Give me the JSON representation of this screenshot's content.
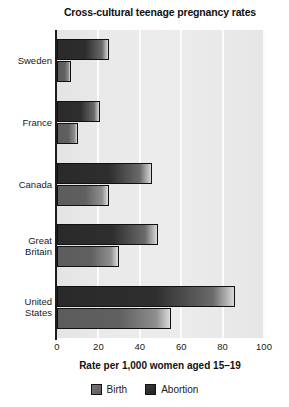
{
  "chart_data": {
    "type": "bar",
    "orientation": "horizontal",
    "title": "Cross-cultural teenage pregnancy rates",
    "xlabel": "Rate per 1,000 women aged 15–19",
    "ylabel": "",
    "xlim": [
      0,
      100
    ],
    "xticks": [
      "0",
      "20",
      "40",
      "60",
      "80",
      "100"
    ],
    "grid": "vertical-white-gridlines",
    "legend_position": "bottom-center",
    "categories": [
      "Sweden",
      "France",
      "Canada",
      "Great\nBritain",
      "United\nStates"
    ],
    "series": [
      {
        "name": "Abortion",
        "color": "#2a2a2a",
        "values": [
          25,
          21,
          46,
          49,
          86
        ]
      },
      {
        "name": "Birth",
        "color": "#5c5c5c",
        "values": [
          7,
          10,
          25,
          30,
          55
        ]
      }
    ]
  },
  "legend": {
    "items": [
      {
        "label": "Birth",
        "swatch": "birth-swatch"
      },
      {
        "label": "Abortion",
        "swatch": "abortion-swatch"
      }
    ]
  }
}
